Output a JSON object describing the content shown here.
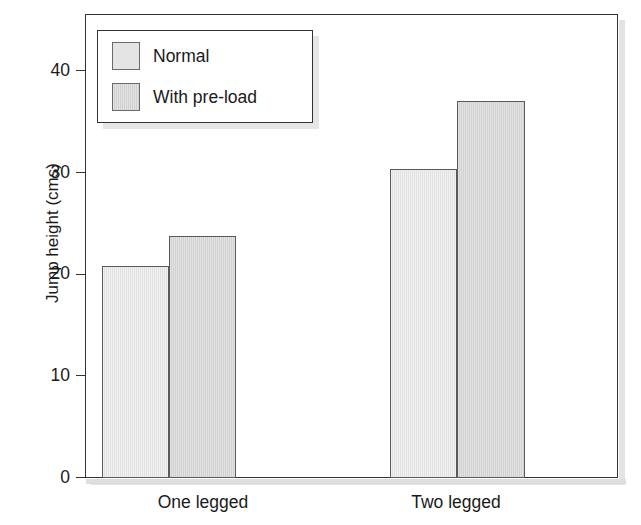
{
  "chart_data": {
    "type": "bar",
    "title": "",
    "subtitle": "",
    "xlabel": "",
    "ylabel": "Jump height (cms)",
    "categories": [
      "One legged",
      "Two legged"
    ],
    "series": [
      {
        "name": "Normal",
        "values": [
          20.8,
          30.4
        ],
        "color": "#e2e2e2"
      },
      {
        "name": "With pre-load",
        "values": [
          23.8,
          37.0
        ],
        "color": "#d2d2d2"
      }
    ],
    "ylim": [
      0,
      46
    ],
    "yticks": [
      0,
      10,
      20,
      30,
      40
    ],
    "ytick_labels": [
      "0",
      "10",
      "20",
      "30",
      "40"
    ],
    "grid": false,
    "legend_position": "upper-left",
    "annotations": []
  },
  "axes": {
    "y_title": "Jump height (cms)",
    "y_ticks": [
      {
        "label": "40",
        "value": 40
      },
      {
        "label": "30",
        "value": 30
      },
      {
        "label": "20",
        "value": 20
      },
      {
        "label": "10",
        "value": 10
      },
      {
        "label": "0",
        "value": 0
      }
    ],
    "x_categories": [
      {
        "label": "One legged"
      },
      {
        "label": "Two legged"
      }
    ]
  },
  "legend": {
    "entries": [
      {
        "label": "Normal",
        "swatch": "normal"
      },
      {
        "label": "With pre-load",
        "swatch": "preload"
      }
    ]
  },
  "bars": [
    {
      "series": "Normal",
      "category": "One legged",
      "value": 20.8
    },
    {
      "series": "With pre-load",
      "category": "One legged",
      "value": 23.8
    },
    {
      "series": "Normal",
      "category": "Two legged",
      "value": 30.4
    },
    {
      "series": "With pre-load",
      "category": "Two legged",
      "value": 37.0
    }
  ],
  "colors": {
    "bar_normal": "#e2e2e2",
    "bar_preload": "#d2d2d2",
    "axis": "#333333",
    "text": "#1a1a1a",
    "background": "#ffffff"
  }
}
